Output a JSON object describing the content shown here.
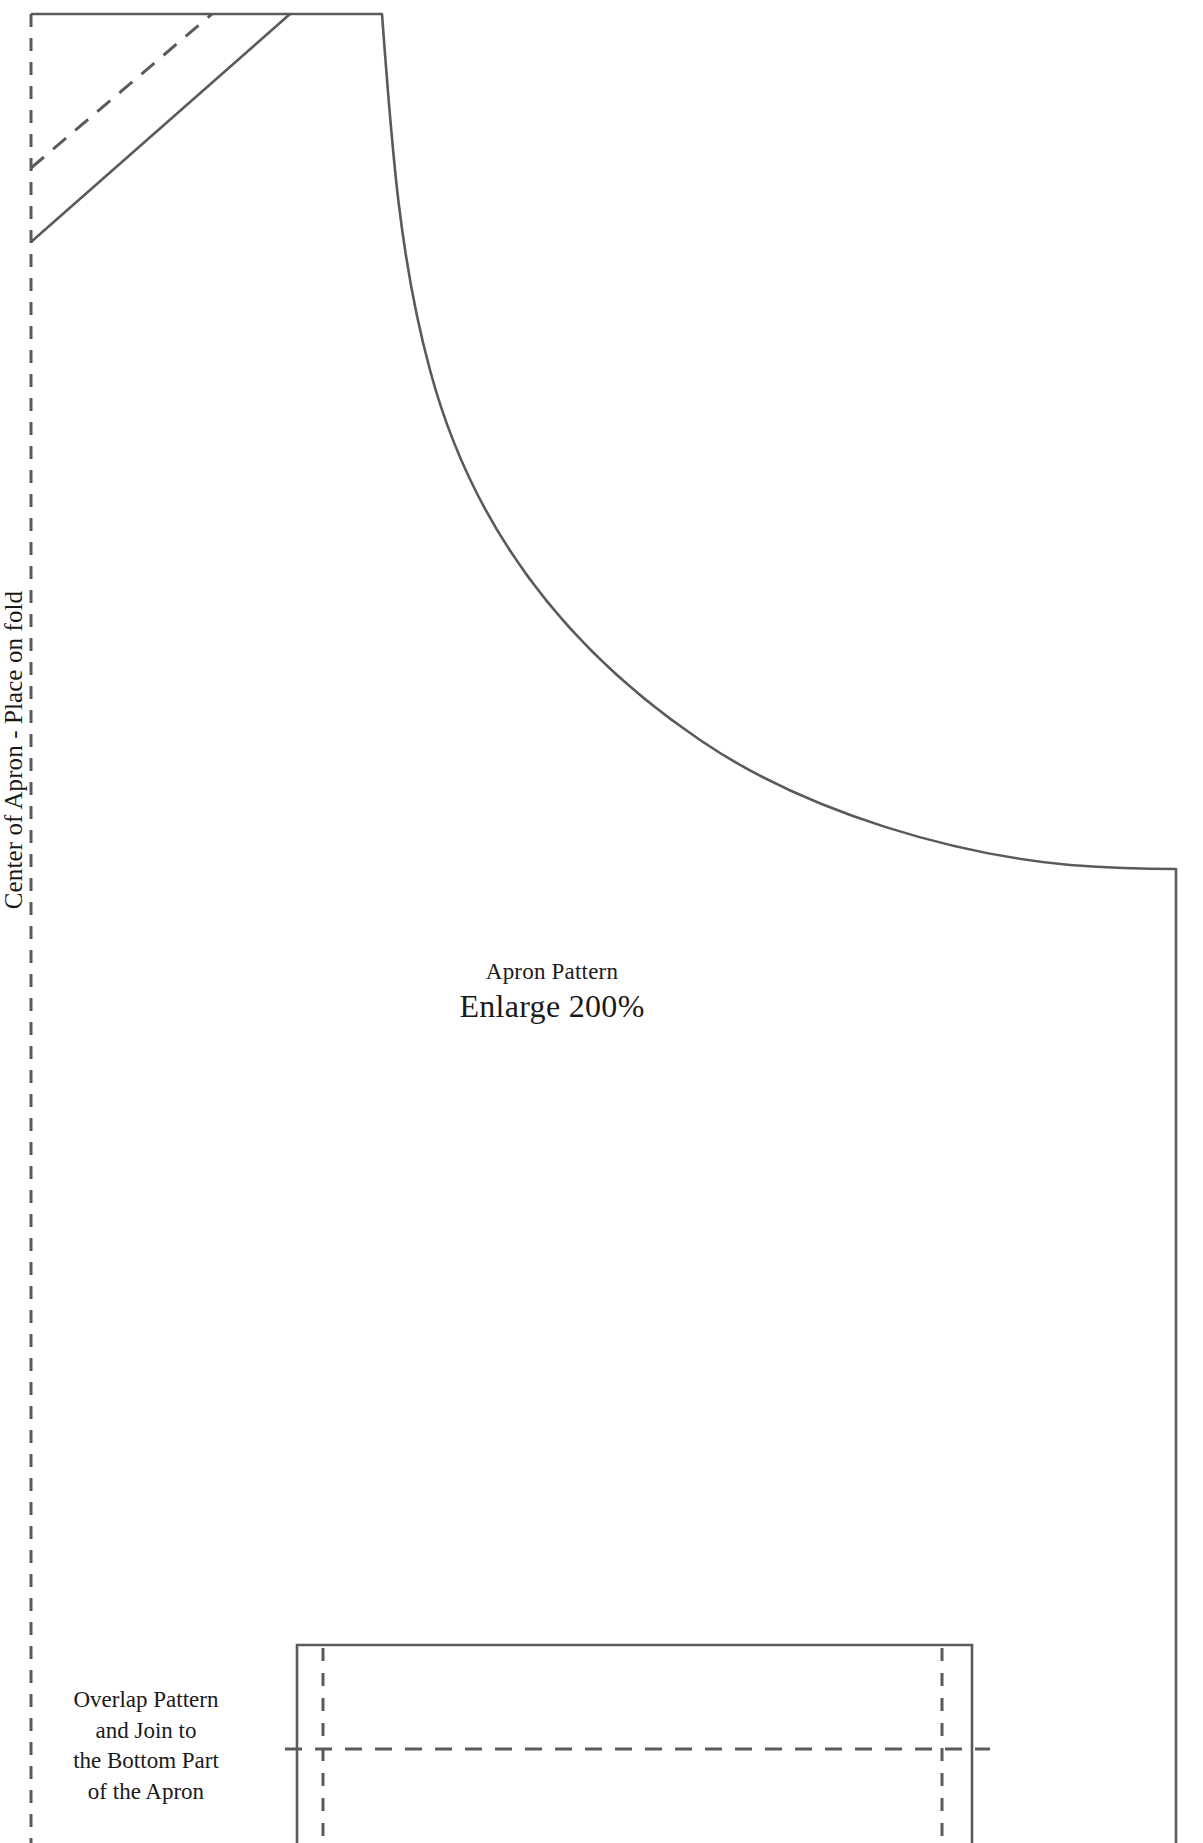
{
  "sheet": {
    "width": 1203,
    "height": 1843,
    "background_color": "#ffffff",
    "line_color": "#5a5a5a",
    "text_color": "#1a1a1a"
  },
  "labels": {
    "fold_line": "Center of Apron - Place on fold",
    "caption_title": "Apron Pattern",
    "caption_enlarge": "Enlarge 200%",
    "overlap_note_lines": [
      "Overlap Pattern",
      "and Join to",
      "the Bottom Part",
      "of the Apron"
    ]
  },
  "pattern_geometry": {
    "fold_line": {
      "name": "center-fold-dashed-line",
      "style": "dashed",
      "x": 31,
      "y_start": 14,
      "y_end": 1843
    },
    "top_edge": {
      "name": "top-edge",
      "style": "solid",
      "from": [
        31,
        14
      ],
      "to": [
        382,
        14
      ]
    },
    "armhole_curve": {
      "name": "armhole-curve",
      "style": "solid",
      "start": [
        382,
        14
      ],
      "end": [
        1176,
        869
      ],
      "control_points": [
        [
          408,
          300
        ],
        [
          520,
          620
        ],
        [
          900,
          846
        ]
      ]
    },
    "right_edge": {
      "name": "right-side-edge",
      "style": "solid",
      "x": 1176,
      "y_start": 869,
      "y_end": 1843
    },
    "strap_solid_diagonal": {
      "name": "strap-cut-line",
      "style": "solid",
      "from": [
        31,
        242
      ],
      "to": [
        290,
        14
      ]
    },
    "strap_dashed_diagonal": {
      "name": "strap-fold-guide",
      "style": "dashed",
      "from": [
        31,
        168
      ],
      "to": [
        212,
        14
      ]
    },
    "overlap_box": {
      "name": "overlap-join-box",
      "left": 297,
      "right": 972,
      "top": 1645,
      "bottom": 1843,
      "border_style": "solid",
      "inner_vertical_dashes_x": [
        323,
        942
      ],
      "inner_horizontal_dash_y": 1749
    }
  }
}
